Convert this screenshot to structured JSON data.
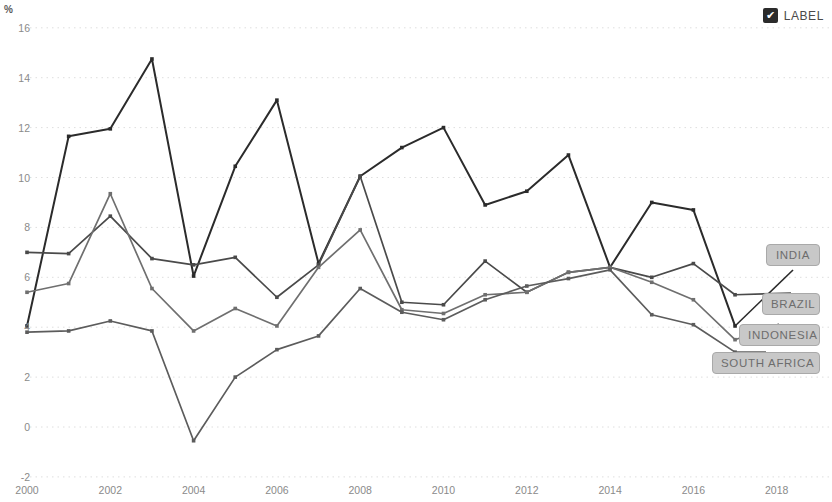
{
  "legend": {
    "checkbox_icon": "checkmark-icon",
    "checked": true,
    "label": "LABEL"
  },
  "axes": {
    "y_unit": "%",
    "y_ticks": [
      "16",
      "14",
      "12",
      "10",
      "8",
      "6",
      "4",
      "2",
      "0",
      "-2"
    ],
    "x_ticks": [
      "2000",
      "2002",
      "2004",
      "2006",
      "2008",
      "2010",
      "2012",
      "2014",
      "2016",
      "2018"
    ]
  },
  "series_labels": [
    {
      "name": "india-label",
      "text": "INDIA"
    },
    {
      "name": "brazil-label",
      "text": "BRAZIL"
    },
    {
      "name": "indonesia-label",
      "text": "INDONESIA"
    },
    {
      "name": "south-africa-label",
      "text": "SOUTH AFRICA"
    }
  ],
  "chart_data": {
    "type": "line",
    "title": "",
    "xlabel": "",
    "ylabel": "%",
    "xlim": [
      2000,
      2018
    ],
    "ylim": [
      -2,
      16
    ],
    "grid": true,
    "legend_position": "right-inline",
    "x": [
      2000,
      2001,
      2002,
      2003,
      2004,
      2005,
      2006,
      2007,
      2008,
      2009,
      2010,
      2011,
      2012,
      2013,
      2014,
      2015,
      2016,
      2017
    ],
    "series": [
      {
        "name": "INDIA",
        "color": "#2b2b2b",
        "values": [
          4.05,
          11.65,
          11.95,
          14.75,
          6.05,
          10.45,
          13.1,
          6.55,
          10.05,
          11.2,
          12.0,
          8.9,
          9.45,
          10.9,
          6.4,
          9.0,
          8.7,
          4.05
        ]
      },
      {
        "name": "BRAZIL",
        "color": "#4a4a4a",
        "values": [
          7.0,
          6.95,
          8.45,
          6.75,
          6.5,
          6.8,
          5.2,
          6.5,
          10.05,
          5.0,
          4.9,
          6.65,
          5.4,
          6.2,
          6.4,
          6.0,
          6.55,
          5.3
        ]
      },
      {
        "name": "INDONESIA",
        "color": "#6f6f6f",
        "values": [
          5.4,
          5.75,
          9.35,
          5.55,
          3.85,
          4.75,
          4.05,
          6.4,
          7.9,
          4.7,
          4.55,
          5.3,
          5.4,
          6.2,
          6.4,
          5.8,
          5.1,
          3.5
        ]
      },
      {
        "name": "SOUTH AFRICA",
        "color": "#5c5c5c",
        "values": [
          3.8,
          3.85,
          4.25,
          3.85,
          -0.55,
          2.0,
          3.1,
          3.65,
          5.55,
          4.6,
          4.3,
          5.1,
          5.65,
          5.95,
          6.3,
          4.5,
          4.1,
          3.0
        ]
      }
    ]
  }
}
